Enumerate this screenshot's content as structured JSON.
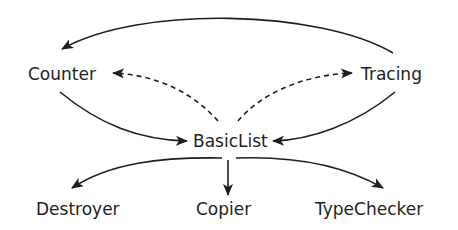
{
  "diagram": {
    "nodes": [
      {
        "id": "counter",
        "label": "Counter"
      },
      {
        "id": "tracing",
        "label": "Tracing"
      },
      {
        "id": "basiclist",
        "label": "BasicList"
      },
      {
        "id": "destroyer",
        "label": "Destroyer"
      },
      {
        "id": "copier",
        "label": "Copier"
      },
      {
        "id": "typechecker",
        "label": "TypeChecker"
      }
    ],
    "edges": [
      {
        "from": "tracing",
        "to": "counter",
        "style": "solid"
      },
      {
        "from": "basiclist",
        "to": "counter",
        "style": "dashed"
      },
      {
        "from": "basiclist",
        "to": "tracing",
        "style": "dashed"
      },
      {
        "from": "counter",
        "to": "basiclist",
        "style": "solid"
      },
      {
        "from": "tracing",
        "to": "basiclist",
        "style": "solid"
      },
      {
        "from": "basiclist",
        "to": "destroyer",
        "style": "solid"
      },
      {
        "from": "basiclist",
        "to": "copier",
        "style": "solid"
      },
      {
        "from": "basiclist",
        "to": "typechecker",
        "style": "solid"
      }
    ],
    "colors": {
      "ink": "#1e1e1e",
      "background": "#ffffff"
    }
  }
}
